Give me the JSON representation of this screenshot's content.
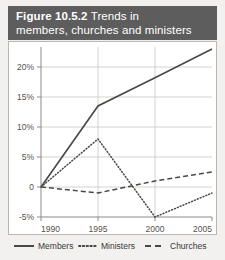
{
  "figure": {
    "title_label": "Figure 10.5.2",
    "title_rest_line1": " Trends in",
    "title_line2": "members, churches and ministers",
    "header_bg": "#5d5d5d",
    "header_fg": "#ffffff",
    "page_bg": "#f2f1ef",
    "plot_bg": "#ffffff"
  },
  "chart_data": {
    "type": "line",
    "title": "Figure 10.5.2 Trends in members, churches and ministers",
    "xlabel": "",
    "ylabel": "",
    "x": [
      1990,
      1995,
      2000,
      2005
    ],
    "categories": [
      "1990",
      "1995",
      "2000",
      "2005"
    ],
    "xtick_labels": [
      "1990",
      "1995",
      "2000",
      "2005"
    ],
    "ytick_labels": [
      "20%",
      "15%",
      "10%",
      "5%",
      "0",
      "-5%"
    ],
    "ytick_values": [
      20,
      15,
      10,
      5,
      0,
      -5
    ],
    "ylim": [
      -5,
      23.5
    ],
    "xlim": [
      1990,
      2005
    ],
    "grid": true,
    "legend_position": "bottom",
    "series": [
      {
        "name": "Members",
        "style": "solid",
        "color": "#4a4845",
        "values": [
          0,
          13.5,
          18.2,
          23.0
        ]
      },
      {
        "name": "Ministers",
        "style": "dotted",
        "color": "#4a4845",
        "values": [
          0,
          8.0,
          -5.0,
          -1.0
        ]
      },
      {
        "name": "Churches",
        "style": "dashed",
        "color": "#4a4845",
        "values": [
          0,
          -1.0,
          1.0,
          2.5
        ]
      }
    ]
  },
  "legend": {
    "items": [
      {
        "label": "Members",
        "style": "solid"
      },
      {
        "label": "Ministers",
        "style": "dotted"
      },
      {
        "label": "Churches",
        "style": "dashed"
      }
    ]
  },
  "axis": {
    "y_labels": [
      "20%",
      "15%",
      "10%",
      "5%",
      "0",
      "-5%"
    ],
    "x_labels": [
      "1990",
      "1995",
      "2000",
      "2005"
    ]
  }
}
